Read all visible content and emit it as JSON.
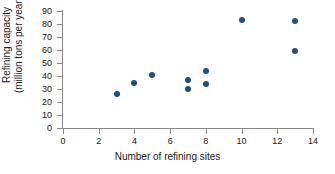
{
  "chart_data": {
    "type": "scatter",
    "title": "",
    "xlabel": "Number of refining sites",
    "ylabel_line1": "Refining capacity",
    "ylabel_line2": "(million tons per year)",
    "xlim": [
      0,
      14
    ],
    "ylim": [
      0,
      90
    ],
    "xticks": [
      0,
      2,
      4,
      6,
      8,
      10,
      12,
      14
    ],
    "yticks": [
      0,
      10,
      20,
      30,
      40,
      50,
      60,
      70,
      80,
      90
    ],
    "grid": false,
    "legend": false,
    "marker_color": "#1f4e87",
    "axis_color": "#8a8a8a",
    "x": [
      3,
      4,
      5,
      7,
      7,
      8,
      8,
      10,
      13,
      13
    ],
    "y": [
      26,
      35,
      41,
      37,
      30,
      44,
      33.5,
      83,
      82.5,
      59
    ],
    "points": [
      {
        "x": 3,
        "y": 26
      },
      {
        "x": 4,
        "y": 35
      },
      {
        "x": 5,
        "y": 41
      },
      {
        "x": 7,
        "y": 37
      },
      {
        "x": 7,
        "y": 30
      },
      {
        "x": 8,
        "y": 44
      },
      {
        "x": 8,
        "y": 33.5
      },
      {
        "x": 10,
        "y": 83
      },
      {
        "x": 13,
        "y": 82.5
      },
      {
        "x": 13,
        "y": 59
      }
    ]
  }
}
